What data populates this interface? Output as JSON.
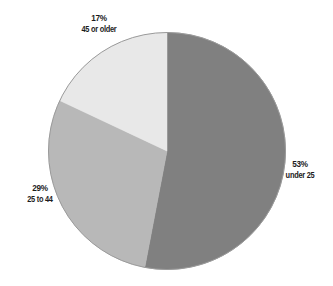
{
  "chart_data": {
    "type": "pie",
    "title": "",
    "subtitle": "",
    "xlabel": "",
    "ylabel": "",
    "legend_position": "none",
    "grid": false,
    "labels_inline": true,
    "start_angle_deg": 0,
    "direction": "clockwise",
    "categories": [
      "under 25",
      "25 to 44",
      "45 or older"
    ],
    "values": [
      53,
      29,
      17
    ],
    "value_unit": "%",
    "slices": [
      {
        "name": "under 25",
        "value": 53,
        "value_label": "53%",
        "color": "#808080",
        "start_deg": 0,
        "end_deg": 190.8
      },
      {
        "name": "25 to 44",
        "value": 29,
        "value_label": "29%",
        "color": "#b8b8b8",
        "start_deg": 190.8,
        "end_deg": 295.2
      },
      {
        "name": "45 or older",
        "value": 17,
        "value_label": "17%",
        "color": "#e8e8e8",
        "start_deg": 295.2,
        "end_deg": 360
      }
    ]
  },
  "labels": {
    "older": {
      "percent": "17%",
      "name": "45 or older"
    },
    "middle": {
      "percent": "29%",
      "name": "25 to 44"
    },
    "young": {
      "percent": "53%",
      "name": "under 25"
    }
  },
  "style": {
    "background": "#ffffff",
    "outline": "#9a9a9a",
    "text": "#1c1c1c"
  }
}
